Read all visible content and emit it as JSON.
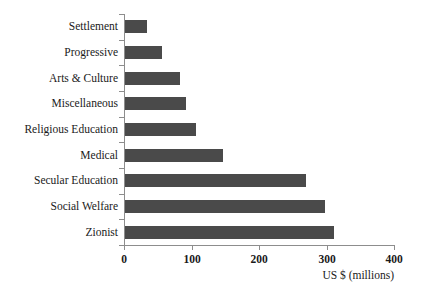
{
  "chart_data": {
    "type": "bar",
    "orientation": "horizontal",
    "title": "",
    "xlabel": "US $ (millions)",
    "ylabel": "",
    "xlim": [
      0,
      400
    ],
    "xticks": [
      0,
      100,
      200,
      300,
      400
    ],
    "xtick_labels": [
      "0",
      "100",
      "200",
      "300",
      "400"
    ],
    "grid": false,
    "legend": null,
    "bar_color": "#4a4a4a",
    "axis_color": "#8d8d8d",
    "categories": [
      "Settlement",
      "Progressive",
      "Arts & Culture",
      "Miscellaneous",
      "Religious Education",
      "Medical",
      "Secular Education",
      "Social Welfare",
      "Zionist"
    ],
    "values": [
      32,
      55,
      81,
      90,
      105,
      145,
      268,
      296,
      310
    ]
  }
}
